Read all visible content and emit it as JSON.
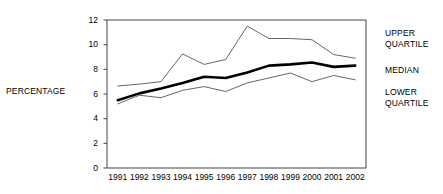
{
  "chart_data": {
    "type": "line",
    "title": "",
    "xlabel": "",
    "ylabel": "PERCENTAGE",
    "categories": [
      "1991",
      "1992",
      "1993",
      "1994",
      "1995",
      "1996",
      "1997",
      "1998",
      "1999",
      "2000",
      "2001",
      "2002"
    ],
    "x": [
      1991,
      1992,
      1993,
      1994,
      1995,
      1996,
      1997,
      1998,
      1999,
      2000,
      2001,
      2002
    ],
    "ylim": [
      0,
      12
    ],
    "xlim": [
      1991,
      2002
    ],
    "yticks": [
      "0",
      "2",
      "4",
      "6",
      "8",
      "10",
      "12"
    ],
    "ytick_values": [
      0,
      2,
      4,
      6,
      8,
      10,
      12
    ],
    "grid": false,
    "legend_position": "right",
    "series": [
      {
        "name": "UPPER QUARTILE",
        "values": [
          6.65,
          6.8,
          7.0,
          9.25,
          8.4,
          8.8,
          11.5,
          10.5,
          10.5,
          10.4,
          9.2,
          8.9
        ],
        "color": "#555555",
        "width": 0.9
      },
      {
        "name": "MEDIAN",
        "values": [
          5.5,
          6.05,
          6.45,
          6.9,
          7.4,
          7.3,
          7.75,
          8.3,
          8.4,
          8.55,
          8.2,
          8.3
        ],
        "color": "#000000",
        "width": 2.6
      },
      {
        "name": "LOWER QUARTILE",
        "values": [
          5.2,
          5.9,
          5.7,
          6.3,
          6.6,
          6.2,
          6.9,
          7.3,
          7.7,
          7.0,
          7.5,
          7.15
        ],
        "color": "#555555",
        "width": 0.9
      }
    ]
  },
  "legend": {
    "upper_line1": "UPPER",
    "upper_line2": "QUARTILE",
    "median": "MEDIAN",
    "lower_line1": "LOWER",
    "lower_line2": "QUARTILE"
  },
  "axis": {
    "y_title": "PERCENTAGE"
  },
  "colors": {
    "axis": "#444444",
    "median_line": "#000000",
    "quartile_line": "#555555",
    "text": "#000000",
    "background": "#ffffff"
  }
}
